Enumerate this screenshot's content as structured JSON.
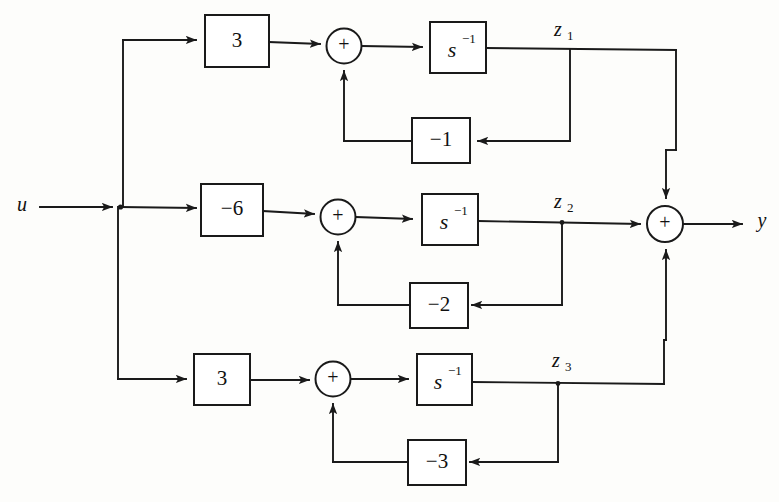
{
  "figure": {
    "input_label": "u",
    "output_label": "y",
    "background_color": "#fdfdfb",
    "line_color": "#1a1a1a"
  },
  "integrator": {
    "base": "s",
    "exponent": "−1",
    "display": "s⁻¹"
  },
  "summer": {
    "sign_label": "+"
  },
  "channels": [
    {
      "id": "channel-1",
      "state_label": "z",
      "state_subscript": "1",
      "state_display": "z₁",
      "forward_gain": "3",
      "feedback_gain": "−1",
      "integrator": "s⁻¹",
      "summer_sign": "+"
    },
    {
      "id": "channel-2",
      "state_label": "z",
      "state_subscript": "2",
      "state_display": "z₂",
      "forward_gain": "−6",
      "feedback_gain": "−2",
      "integrator": "s⁻¹",
      "summer_sign": "+"
    },
    {
      "id": "channel-3",
      "state_label": "z",
      "state_subscript": "3",
      "state_display": "z₃",
      "forward_gain": "3",
      "feedback_gain": "−3",
      "integrator": "s⁻¹",
      "summer_sign": "+"
    }
  ],
  "output_summer": {
    "sign_label": "+"
  }
}
